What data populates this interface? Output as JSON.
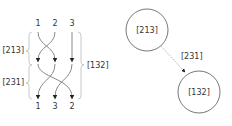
{
  "braid": {
    "top_labels": [
      "1",
      "2",
      "3"
    ],
    "bottom_labels": [
      "1",
      "3",
      "2"
    ],
    "left_braces": [
      {
        "label": "[213]"
      },
      {
        "label": "[231]"
      }
    ],
    "right_brace": {
      "label": "[132]"
    }
  },
  "graph": {
    "nodes": [
      {
        "id": "n1",
        "label": "[213]"
      },
      {
        "id": "n2",
        "label": "[132]"
      }
    ],
    "edge": {
      "label": "[231]"
    }
  },
  "colors": {
    "strand": "#888888",
    "brace": "#bbbbbb",
    "text": "#333333",
    "node_stroke": "#555555",
    "edge": "#aaaaaa"
  }
}
